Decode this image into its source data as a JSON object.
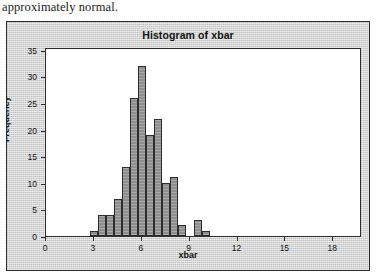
{
  "caption": {
    "text": "approximately normal."
  },
  "figure": {
    "title": "Histogram of xbar",
    "xlabel": "xbar",
    "ylabel": "Frequency"
  },
  "chart_data": {
    "type": "bar",
    "title": "Histogram of xbar",
    "xlabel": "xbar",
    "ylabel": "Frequency",
    "xlim": [
      0,
      19.8
    ],
    "ylim": [
      0,
      35.5
    ],
    "xticks": [
      0,
      3,
      6,
      9,
      12,
      15,
      18
    ],
    "yticks": [
      0,
      5,
      10,
      15,
      20,
      25,
      30,
      35
    ],
    "grid": false,
    "legend": false,
    "bin_width": 0.5,
    "bins": [
      {
        "left": 2.75,
        "right": 3.25,
        "value": 1
      },
      {
        "left": 3.25,
        "right": 3.75,
        "value": 4
      },
      {
        "left": 3.75,
        "right": 4.25,
        "value": 4
      },
      {
        "left": 4.25,
        "right": 4.75,
        "value": 7
      },
      {
        "left": 4.75,
        "right": 5.25,
        "value": 13
      },
      {
        "left": 5.25,
        "right": 5.75,
        "value": 26
      },
      {
        "left": 5.75,
        "right": 6.25,
        "value": 32
      },
      {
        "left": 6.25,
        "right": 6.75,
        "value": 19
      },
      {
        "left": 6.75,
        "right": 7.25,
        "value": 22
      },
      {
        "left": 7.25,
        "right": 7.75,
        "value": 10
      },
      {
        "left": 7.75,
        "right": 8.25,
        "value": 11
      },
      {
        "left": 8.25,
        "right": 8.75,
        "value": 2
      },
      {
        "left": 9.25,
        "right": 9.75,
        "value": 3
      },
      {
        "left": 9.75,
        "right": 10.25,
        "value": 1
      }
    ]
  },
  "axis_labels": {
    "x": [
      "0",
      "3",
      "6",
      "9",
      "12",
      "15",
      "18"
    ],
    "y": [
      "0",
      "5",
      "10",
      "15",
      "20",
      "25",
      "30",
      "35"
    ]
  }
}
